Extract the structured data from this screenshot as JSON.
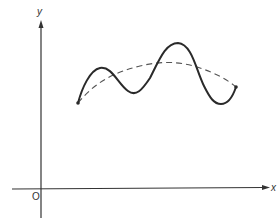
{
  "diagram": {
    "axes": {
      "x_label": "x",
      "y_label": "y",
      "origin_label": "O"
    },
    "curves": [
      {
        "name": "oscillating-curve",
        "style": "solid",
        "color": "#2a2a2a"
      },
      {
        "name": "smooth-trend-curve",
        "style": "dashed",
        "color": "#555555"
      }
    ],
    "colors": {
      "axis": "#333333",
      "background": "#ffffff"
    }
  }
}
